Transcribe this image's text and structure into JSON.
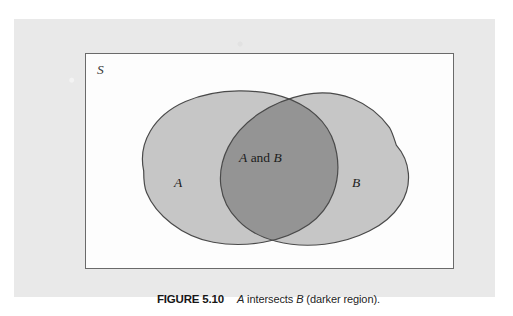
{
  "figure": {
    "caption_number": "FIGURE 5.10",
    "caption_text_parts": {
      "set_a": "A",
      "middle": " intersects ",
      "set_b": "B",
      "tail": " (darker region)."
    },
    "caption_full": "FIGURE 5.10   A intersects B (darker region)."
  },
  "venn": {
    "sample_space_label": "S",
    "set_a_label": "A",
    "set_b_label": "B",
    "intersection_label_parts": {
      "a": "A",
      "and": " and ",
      "b": "B"
    },
    "intersection_label": "A and B"
  },
  "colors": {
    "page_background": "#ffffff",
    "panel_background": "#e9e9e9",
    "box_background": "#fdfdfd",
    "box_border": "#6a6a6a",
    "set_fill": "#c6c6c6",
    "intersection_fill": "#949494",
    "outline": "#4a4a4a",
    "text": "#1c1c1c"
  }
}
